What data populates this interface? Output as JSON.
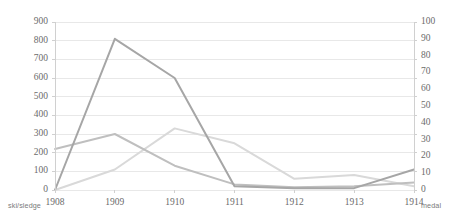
{
  "chart_data": {
    "type": "line",
    "title": "",
    "subtitle": "",
    "xlabel": "ski/sledge",
    "ylabel": "",
    "y2label": "medal",
    "categories": [
      "1908",
      "1909",
      "1910",
      "1911",
      "1912",
      "1913",
      "1914"
    ],
    "x": [
      1908,
      1909,
      1910,
      1911,
      1912,
      1913,
      1914
    ],
    "ylim": [
      0,
      900
    ],
    "y2lim": [
      0,
      100
    ],
    "yticks": [
      0,
      100,
      200,
      300,
      400,
      500,
      600,
      700,
      800,
      900
    ],
    "y2ticks": [
      0,
      10,
      20,
      30,
      40,
      50,
      60,
      70,
      80,
      90,
      100
    ],
    "grid": true,
    "legend": "none",
    "series": [
      {
        "name": "series-1",
        "axis": "left",
        "color": "#a6a6a6",
        "values": [
          0,
          810,
          600,
          20,
          10,
          10,
          110
        ]
      },
      {
        "name": "series-2",
        "axis": "left",
        "color": "#bfbfbf",
        "values": [
          220,
          300,
          130,
          30,
          15,
          20,
          40
        ]
      },
      {
        "name": "series-3",
        "axis": "left",
        "color": "#d9d9d9",
        "values": [
          0,
          110,
          330,
          250,
          60,
          80,
          20
        ]
      }
    ]
  },
  "axes": {
    "left_ticks": [
      "900",
      "800",
      "700",
      "600",
      "500",
      "400",
      "300",
      "200",
      "100",
      "0"
    ],
    "right_ticks": [
      "100",
      "90",
      "80",
      "70",
      "60",
      "50",
      "40",
      "30",
      "20",
      "10",
      "0"
    ],
    "x_ticks": [
      "1908",
      "1909",
      "1910",
      "1911",
      "1912",
      "1913",
      "1914"
    ],
    "bottom_left_label": "ski/sledge",
    "bottom_right_label": "medal"
  },
  "colors": {
    "grid": "#e8e8e8",
    "text": "#6b6b6b",
    "background": "#ffffff"
  }
}
